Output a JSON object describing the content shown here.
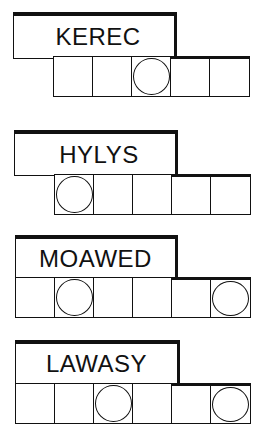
{
  "puzzles": [
    {
      "scrambled": "KEREC",
      "letter_count": 5,
      "circled_positions": [
        3
      ]
    },
    {
      "scrambled": "HYLYS",
      "letter_count": 5,
      "circled_positions": [
        1
      ]
    },
    {
      "scrambled": "MOAWED",
      "letter_count": 6,
      "circled_positions": [
        2,
        6
      ]
    },
    {
      "scrambled": "LAWASY",
      "letter_count": 6,
      "circled_positions": [
        3,
        6
      ]
    }
  ],
  "colors": {
    "ink": "#111111",
    "background": "#ffffff"
  }
}
